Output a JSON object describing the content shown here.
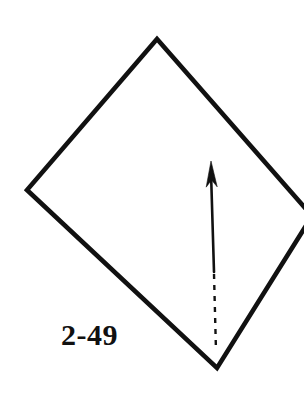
{
  "figure": {
    "label": "2-49",
    "background_color": "#ffffff",
    "ink_color": "#111111",
    "width": 304,
    "height": 405,
    "shapes": {
      "rhombus": {
        "name": "rhombus-outline",
        "stroke_color": "#111111",
        "stroke_width": 4.6,
        "closed": true,
        "clipped_right_edge": true,
        "vertices": [
          {
            "name": "top",
            "x": 157,
            "y": 39
          },
          {
            "name": "right",
            "x": 312,
            "y": 216
          },
          {
            "name": "bottom",
            "x": 217,
            "y": 368
          },
          {
            "name": "left",
            "x": 27,
            "y": 190
          }
        ]
      },
      "arrow": {
        "name": "up-arrow",
        "stroke_color": "#111111",
        "direction": "up",
        "tip": {
          "x": 211,
          "y": 161
        },
        "solid_segment": {
          "x1": 211,
          "y1": 172,
          "x2": 214,
          "y2": 272,
          "stroke_width": 2.6
        },
        "dashed_segment": {
          "x1": 214,
          "y1": 274,
          "x2": 216,
          "y2": 351,
          "stroke_width": 2.4,
          "dash_length": 5,
          "dash_gap": 6
        },
        "head": {
          "name": "arrow-head",
          "length": 26,
          "half_width": 5.5,
          "barb_inset": 7,
          "style": "barbed"
        }
      }
    }
  }
}
